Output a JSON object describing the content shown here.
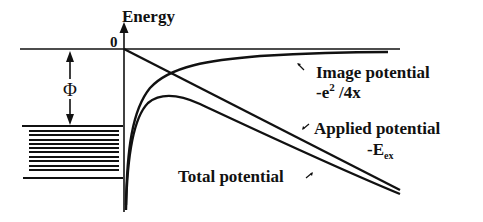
{
  "diagram": {
    "axis": {
      "y_label": "Energy",
      "origin_label": "0"
    },
    "work_function": {
      "symbol": "Φ"
    },
    "curves": {
      "image_potential": {
        "label": "Image potential",
        "formula_prefix": "-e",
        "formula_sup": "2",
        "formula_suffix": " /4x"
      },
      "applied_potential": {
        "label": "Applied potential",
        "formula_prefix": "-E",
        "formula_sub": "ex"
      },
      "total_potential": {
        "label": "Total potential"
      }
    },
    "colors": {
      "ink": "#111111",
      "background": "#ffffff"
    }
  }
}
